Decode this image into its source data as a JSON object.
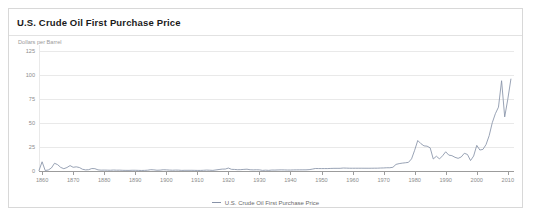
{
  "chart_data": {
    "type": "line",
    "title": "U.S. Crude Oil First Purchase Price",
    "subtitle": "Dollars per Barrel",
    "ylabel": "Dollars per Barrel",
    "xlabel": "",
    "grid": true,
    "legend_position": "bottom",
    "legend": [
      "U.S. Crude Oil First Purchase Price"
    ],
    "series_color": "#8792a8",
    "ylim": [
      0,
      125
    ],
    "xlim": [
      1859,
      2012
    ],
    "yticks": [
      0,
      25,
      50,
      75,
      100,
      125
    ],
    "ytick_labels": [
      "0",
      "25",
      "50",
      "75",
      "100",
      "125"
    ],
    "xticks": [
      1860,
      1870,
      1880,
      1890,
      1900,
      1910,
      1920,
      1930,
      1940,
      1950,
      1960,
      1970,
      1980,
      1990,
      2000,
      2010
    ],
    "xtick_labels": [
      "1860",
      "1870",
      "1880",
      "1890",
      "1900",
      "1910",
      "1920",
      "1930",
      "1940",
      "1950",
      "1960",
      "1970",
      "1980",
      "1990",
      "2000",
      "2010"
    ],
    "series": [
      {
        "name": "U.S. Crude Oil First Purchase Price",
        "x": [
          1859,
          1860,
          1861,
          1862,
          1863,
          1864,
          1865,
          1866,
          1867,
          1868,
          1869,
          1870,
          1871,
          1872,
          1873,
          1874,
          1875,
          1876,
          1877,
          1878,
          1879,
          1880,
          1881,
          1882,
          1883,
          1884,
          1885,
          1886,
          1887,
          1888,
          1889,
          1890,
          1891,
          1892,
          1893,
          1894,
          1895,
          1896,
          1897,
          1898,
          1899,
          1900,
          1901,
          1902,
          1903,
          1904,
          1905,
          1906,
          1907,
          1908,
          1909,
          1910,
          1911,
          1912,
          1913,
          1914,
          1915,
          1916,
          1917,
          1918,
          1919,
          1920,
          1921,
          1922,
          1923,
          1924,
          1925,
          1926,
          1927,
          1928,
          1929,
          1930,
          1931,
          1932,
          1933,
          1934,
          1935,
          1936,
          1937,
          1938,
          1939,
          1940,
          1941,
          1942,
          1943,
          1944,
          1945,
          1946,
          1947,
          1948,
          1949,
          1950,
          1951,
          1952,
          1953,
          1954,
          1955,
          1956,
          1957,
          1958,
          1959,
          1960,
          1961,
          1962,
          1963,
          1964,
          1965,
          1966,
          1967,
          1968,
          1969,
          1970,
          1971,
          1972,
          1973,
          1974,
          1975,
          1976,
          1977,
          1978,
          1979,
          1980,
          1981,
          1982,
          1983,
          1984,
          1985,
          1986,
          1987,
          1988,
          1989,
          1990,
          1991,
          1992,
          1993,
          1994,
          1995,
          1996,
          1997,
          1998,
          1999,
          2000,
          2001,
          2002,
          2003,
          2004,
          2005,
          2006,
          2007,
          2008,
          2009,
          2010,
          2011
        ],
        "values": [
          0.49,
          9.59,
          0.52,
          1.05,
          3.15,
          8.06,
          6.59,
          3.74,
          2.41,
          3.63,
          5.64,
          3.86,
          4.34,
          3.64,
          1.83,
          1.17,
          1.35,
          2.56,
          2.42,
          1.19,
          0.86,
          0.95,
          0.86,
          0.78,
          1.0,
          0.84,
          0.88,
          0.71,
          0.67,
          0.65,
          0.77,
          0.77,
          0.67,
          0.56,
          0.64,
          0.84,
          1.36,
          1.18,
          0.79,
          0.91,
          1.29,
          1.19,
          0.96,
          0.8,
          0.94,
          0.86,
          0.62,
          0.73,
          0.72,
          0.72,
          0.7,
          0.61,
          0.61,
          0.74,
          0.95,
          0.81,
          0.64,
          1.1,
          1.56,
          1.98,
          2.01,
          3.07,
          1.73,
          1.61,
          1.34,
          1.43,
          1.68,
          1.88,
          1.3,
          1.17,
          1.27,
          1.19,
          0.65,
          0.87,
          0.67,
          1.0,
          0.97,
          1.09,
          1.18,
          1.13,
          1.02,
          1.02,
          1.14,
          1.19,
          1.2,
          1.21,
          1.22,
          1.41,
          1.93,
          2.6,
          2.54,
          2.51,
          2.53,
          2.53,
          2.68,
          2.78,
          2.77,
          2.79,
          3.09,
          3.0,
          2.9,
          2.88,
          2.89,
          2.9,
          2.89,
          2.88,
          2.86,
          2.88,
          2.92,
          2.94,
          3.09,
          3.18,
          3.39,
          3.39,
          3.89,
          6.87,
          7.67,
          8.19,
          8.57,
          9.0,
          12.64,
          21.59,
          31.77,
          28.52,
          26.19,
          25.88,
          24.09,
          12.51,
          15.4,
          12.58,
          15.86,
          20.03,
          16.54,
          15.99,
          14.25,
          13.19,
          14.62,
          18.46,
          17.23,
          10.87,
          15.56,
          26.72,
          21.84,
          22.51,
          27.56,
          36.77,
          50.28,
          59.69,
          66.52,
          94.04,
          56.35,
          74.71,
          95.73
        ]
      }
    ]
  },
  "legend": {
    "entry_label": "U.S. Crude Oil First Purchase Price"
  }
}
